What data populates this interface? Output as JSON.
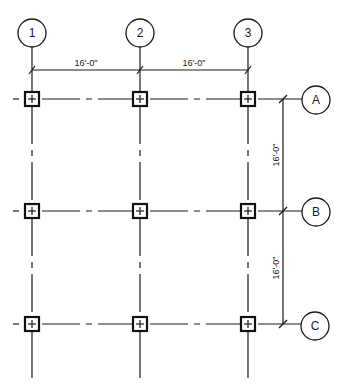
{
  "drawing": {
    "type": "structural-grid-plan",
    "columns": [
      {
        "label": "1",
        "x": 32
      },
      {
        "label": "2",
        "x": 140
      },
      {
        "label": "3",
        "x": 248
      }
    ],
    "rows": [
      {
        "label": "A",
        "y": 99
      },
      {
        "label": "B",
        "y": 211
      },
      {
        "label": "C",
        "y": 324
      }
    ],
    "dimensions": {
      "horizontal": [
        "16'-0\"",
        "16'-0\""
      ],
      "vertical": [
        "16'-0\"",
        "16'-0\""
      ]
    },
    "colors": {
      "line": "#1a1a1a",
      "background": "#ffffff"
    }
  }
}
